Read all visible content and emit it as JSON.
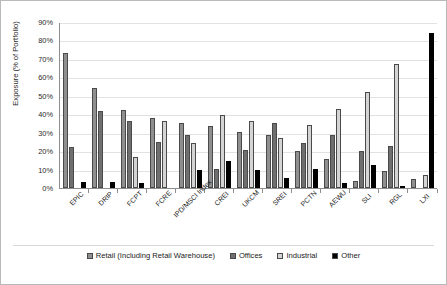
{
  "chart_data": {
    "type": "bar",
    "title": "",
    "xlabel": "",
    "ylabel": "Exposure (% of Portfolio)",
    "ylim": [
      0,
      90
    ],
    "ytick_step": 10,
    "ytick_labels": [
      "0%",
      "10%",
      "20%",
      "30%",
      "40%",
      "50%",
      "60%",
      "70%",
      "80%",
      "90%"
    ],
    "grid": "horizontal",
    "legend_position": "bottom",
    "categories": [
      "EPIC",
      "DRIP",
      "FCPT",
      "FCRE",
      "IPD/MSCI Index",
      "CREI",
      "UKCM",
      "SREI",
      "PCTN",
      "AEWU",
      "SLI",
      "RGL",
      "LXI"
    ],
    "series": [
      {
        "name": "Retail (Including Retail Warehouse)",
        "color": "#8f8f8f",
        "values": [
          73,
          54,
          42.5,
          38,
          35,
          33.5,
          30.5,
          29,
          20,
          15.5,
          4,
          9,
          5
        ]
      },
      {
        "name": "Offices",
        "color": "#6f6f6f",
        "values": [
          22,
          41.5,
          36.5,
          25,
          28.5,
          10.5,
          20.5,
          35.5,
          24.5,
          29,
          20,
          23,
          0
        ]
      },
      {
        "name": "Industrial",
        "color": "#d4d4d4",
        "values": [
          0,
          0,
          17,
          36.5,
          24.5,
          39.5,
          36.5,
          27,
          34,
          43,
          52,
          67.5,
          7
        ]
      },
      {
        "name": "Other",
        "color": "#000000",
        "values": [
          3.5,
          3,
          2.5,
          0,
          9.5,
          14.5,
          10,
          5.5,
          10.5,
          2.5,
          12.5,
          1,
          84
        ]
      }
    ]
  },
  "legend": {
    "items": [
      {
        "label": "Retail (Including Retail Warehouse)",
        "swatch": "retail-swatch"
      },
      {
        "label": "Offices",
        "swatch": "offices-swatch"
      },
      {
        "label": "Industrial",
        "swatch": "industrial-swatch"
      },
      {
        "label": "Other",
        "swatch": "other-swatch"
      }
    ]
  }
}
